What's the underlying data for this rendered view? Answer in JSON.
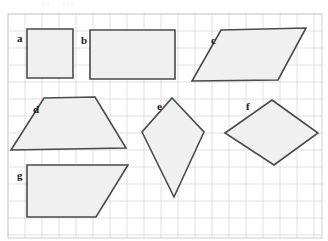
{
  "page": {
    "width": 328,
    "height": 241,
    "background_color": "#ffffff"
  },
  "grid": {
    "visible": true,
    "x_start": 8,
    "y_start": 14,
    "x_end": 322,
    "y_end": 238,
    "spacing": 17,
    "line_color": "#d8d8d8",
    "border_color": "#cfcfcf"
  },
  "style": {
    "shape_fill": "#f0f0f0",
    "shape_stroke": "#4a4a4a",
    "label_color": "#1a1a1a"
  },
  "shapes": [
    {
      "label": "a",
      "name": "square",
      "label_x": 17,
      "label_y": 42,
      "points": "27,29 73,29 73,78 27,78"
    },
    {
      "label": "b",
      "name": "rectangle",
      "label_x": 81,
      "label_y": 44,
      "points": "90,30 175,30 175,79 90,79"
    },
    {
      "label": "c",
      "name": "parallelogram",
      "label_x": 211,
      "label_y": 44,
      "points": "221,30 306,28 278,80 192,81"
    },
    {
      "label": "d",
      "name": "trapezoid",
      "label_x": 33,
      "label_y": 113,
      "points": "44,98 95,97 126,148 11,150"
    },
    {
      "label": "e",
      "name": "kite",
      "label_x": 157,
      "label_y": 110,
      "points": "172,98 204,132 174,197 142,132"
    },
    {
      "label": "f",
      "name": "rhombus",
      "label_x": 246,
      "label_y": 110,
      "points": "272,100 318,133 274,165 225,133"
    },
    {
      "label": "g",
      "name": "right-trapezoid",
      "label_x": 17,
      "label_y": 179,
      "points": "27,165 128,165 96,217 27,217"
    }
  ]
}
